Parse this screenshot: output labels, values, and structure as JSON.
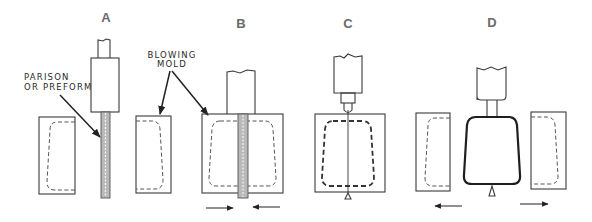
{
  "diagram": {
    "colors": {
      "line": "#3a3a3a",
      "label": "#6a6a6a",
      "parison": "#b9b9b9",
      "background": "#ffffff"
    },
    "stages": [
      {
        "id": "A",
        "label": "A"
      },
      {
        "id": "B",
        "label": "B"
      },
      {
        "id": "C",
        "label": "C"
      },
      {
        "id": "D",
        "label": "D"
      }
    ],
    "callouts": {
      "parison": {
        "line1": "PARISON",
        "line2": "OR PREFORM"
      },
      "blowing_mold": {
        "line1": "BLOWING",
        "line2": "MOLD"
      }
    },
    "arrows": {
      "stage_b": [
        "mold-closing-left",
        "mold-closing-right"
      ],
      "stage_d": [
        "mold-opening-left",
        "mold-opening-right"
      ]
    }
  }
}
